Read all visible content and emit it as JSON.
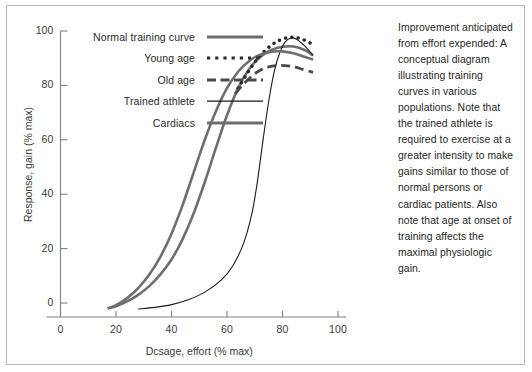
{
  "chart_data": {
    "type": "line",
    "title": "",
    "xlabel": "Dcsage, effort (% max)",
    "ylabel": "Response, gain (% max)",
    "xlim": [
      -8,
      104
    ],
    "ylim": [
      -8,
      104
    ],
    "xticks": [
      0,
      20,
      40,
      60,
      80,
      100
    ],
    "yticks": [
      0,
      20,
      40,
      60,
      80,
      100
    ],
    "xticklabels": [
      "0",
      "20",
      "40",
      "60",
      "80",
      "100"
    ],
    "yticklabels": [
      "0",
      "20",
      "40",
      "60",
      "80",
      "100"
    ],
    "grid": false,
    "legend_position": "upper-left-inside",
    "series": [
      {
        "name": "Normal training curve",
        "style": "solid-thick",
        "color": "#6e6e6e",
        "width": 2.6,
        "points": [
          [
            17,
            -2
          ],
          [
            20,
            -1.2
          ],
          [
            24,
            0.6
          ],
          [
            28,
            3.0
          ],
          [
            32,
            6.2
          ],
          [
            36,
            10.5
          ],
          [
            40,
            16.0
          ],
          [
            44,
            23.5
          ],
          [
            48,
            33.0
          ],
          [
            52,
            44.5
          ],
          [
            56,
            57.0
          ],
          [
            60,
            69.0
          ],
          [
            64,
            79.0
          ],
          [
            68,
            86.0
          ],
          [
            72,
            90.5
          ],
          [
            76,
            93.0
          ],
          [
            80,
            94.2
          ],
          [
            84,
            94.3
          ],
          [
            88,
            93.0
          ],
          [
            91,
            91.0
          ]
        ]
      },
      {
        "name": "Young age",
        "style": "dotted",
        "color": "#2b2b2b",
        "width": 2.8,
        "points": [
          [
            64,
            79.0
          ],
          [
            67,
            84.0
          ],
          [
            70,
            88.5
          ],
          [
            73,
            92.0
          ],
          [
            76,
            94.8
          ],
          [
            79,
            96.6
          ],
          [
            82,
            97.6
          ],
          [
            85,
            97.6
          ],
          [
            88,
            96.6
          ],
          [
            91,
            95.0
          ]
        ]
      },
      {
        "name": "Old age",
        "style": "dashed",
        "color": "#4a4a4a",
        "width": 2.8,
        "points": [
          [
            63,
            77.0
          ],
          [
            66,
            80.5
          ],
          [
            69,
            83.5
          ],
          [
            72,
            85.6
          ],
          [
            75,
            86.8
          ],
          [
            78,
            87.3
          ],
          [
            81,
            87.3
          ],
          [
            84,
            86.8
          ],
          [
            87,
            86.0
          ],
          [
            91,
            84.8
          ]
        ]
      },
      {
        "name": "Trained athlete",
        "style": "solid-thin",
        "color": "#1a1a1a",
        "width": 1.1,
        "points": [
          [
            28,
            -2.2
          ],
          [
            34,
            -1.6
          ],
          [
            40,
            -0.6
          ],
          [
            46,
            1.2
          ],
          [
            52,
            4.0
          ],
          [
            58,
            8.5
          ],
          [
            62,
            13.5
          ],
          [
            66,
            22.0
          ],
          [
            69,
            33.0
          ],
          [
            71,
            45.0
          ],
          [
            73,
            60.0
          ],
          [
            75,
            74.0
          ],
          [
            77,
            85.0
          ],
          [
            79,
            92.0
          ],
          [
            81,
            96.0
          ],
          [
            83,
            97.4
          ],
          [
            85,
            97.0
          ],
          [
            88,
            94.5
          ],
          [
            91,
            91.0
          ]
        ]
      },
      {
        "name": "Cardiacs",
        "style": "solid-thick",
        "color": "#6e6e6e",
        "width": 2.6,
        "points": [
          [
            17,
            -2
          ],
          [
            20,
            -0.8
          ],
          [
            24,
            1.8
          ],
          [
            28,
            5.5
          ],
          [
            32,
            10.5
          ],
          [
            36,
            17.0
          ],
          [
            40,
            25.5
          ],
          [
            44,
            36.0
          ],
          [
            48,
            48.0
          ],
          [
            52,
            60.0
          ],
          [
            56,
            70.5
          ],
          [
            60,
            79.0
          ],
          [
            64,
            85.0
          ],
          [
            68,
            89.0
          ],
          [
            72,
            91.3
          ],
          [
            76,
            92.4
          ],
          [
            80,
            92.5
          ],
          [
            84,
            91.8
          ],
          [
            88,
            90.5
          ],
          [
            91,
            89.5
          ]
        ]
      }
    ]
  },
  "legend": {
    "items": [
      {
        "label": "Normal training curve",
        "icon": "solid-thick-line-icon"
      },
      {
        "label": "Young age",
        "icon": "dotted-line-icon"
      },
      {
        "label": "Old age",
        "icon": "dashed-line-icon"
      },
      {
        "label": "Trained athlete",
        "icon": "solid-thin-line-icon"
      },
      {
        "label": "Cardiacs",
        "icon": "solid-thick-line-icon"
      }
    ]
  },
  "caption": {
    "text": "Improvement anticipated from effort expended: A conceptual diagram illustrating training curves in various populations. Note that the trained athlete is required to exercise at a greater intensity to make gains similar to those of normal persons or cardiac patients. Also note that age at onset of training affects the maximal physiologic gain."
  },
  "colors": {
    "frame": "#b9b9b9",
    "axis": "#808080",
    "gray_curve": "#6e6e6e",
    "dark_curve": "#1a1a1a",
    "text": "#222222",
    "background": "#ffffff"
  }
}
